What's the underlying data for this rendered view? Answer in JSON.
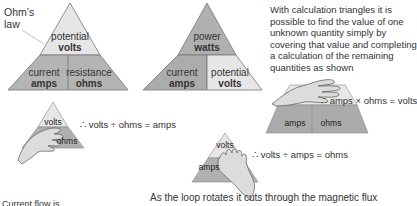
{
  "ohms_law_label": "Ohm’s\nlaw",
  "ohms_triangle": {
    "top": {
      "name": "potential",
      "unit": "volts"
    },
    "bottom_left": {
      "name": "current",
      "unit": "amps"
    },
    "bottom_right": {
      "name": "resistance",
      "unit": "ohms"
    }
  },
  "power_triangle": {
    "top": {
      "name": "power",
      "unit": "watts"
    },
    "bottom_left": {
      "name": "current",
      "unit": "amps"
    },
    "bottom_right": {
      "name": "potential",
      "unit": "volts"
    }
  },
  "description": "With calculation triangles it is possible to find the value of one unknown quantity simply by covering that value and completing a calculation of the remaining quantities as shown",
  "examples": [
    {
      "visible_top": "volts",
      "visible_bottom": "ohms",
      "equation": "∴ volts ÷ ohms = amps"
    },
    {
      "visible_left": "amps",
      "visible_right": "ohms",
      "equation": "∴ amps × ohms = volts"
    },
    {
      "visible_top": "volts",
      "visible_bottom": "amps",
      "equation": "∴ volts ÷ amps = ohms"
    }
  ],
  "footer_left": "Current flow is",
  "footer_right": "As the loop rotates it cuts through the magnetic flux",
  "colors": {
    "top_light": "#e4e4e4",
    "mid_gray": "#b9b9b9",
    "dark_gray": "#a6a6a6",
    "outline": "#777777"
  }
}
